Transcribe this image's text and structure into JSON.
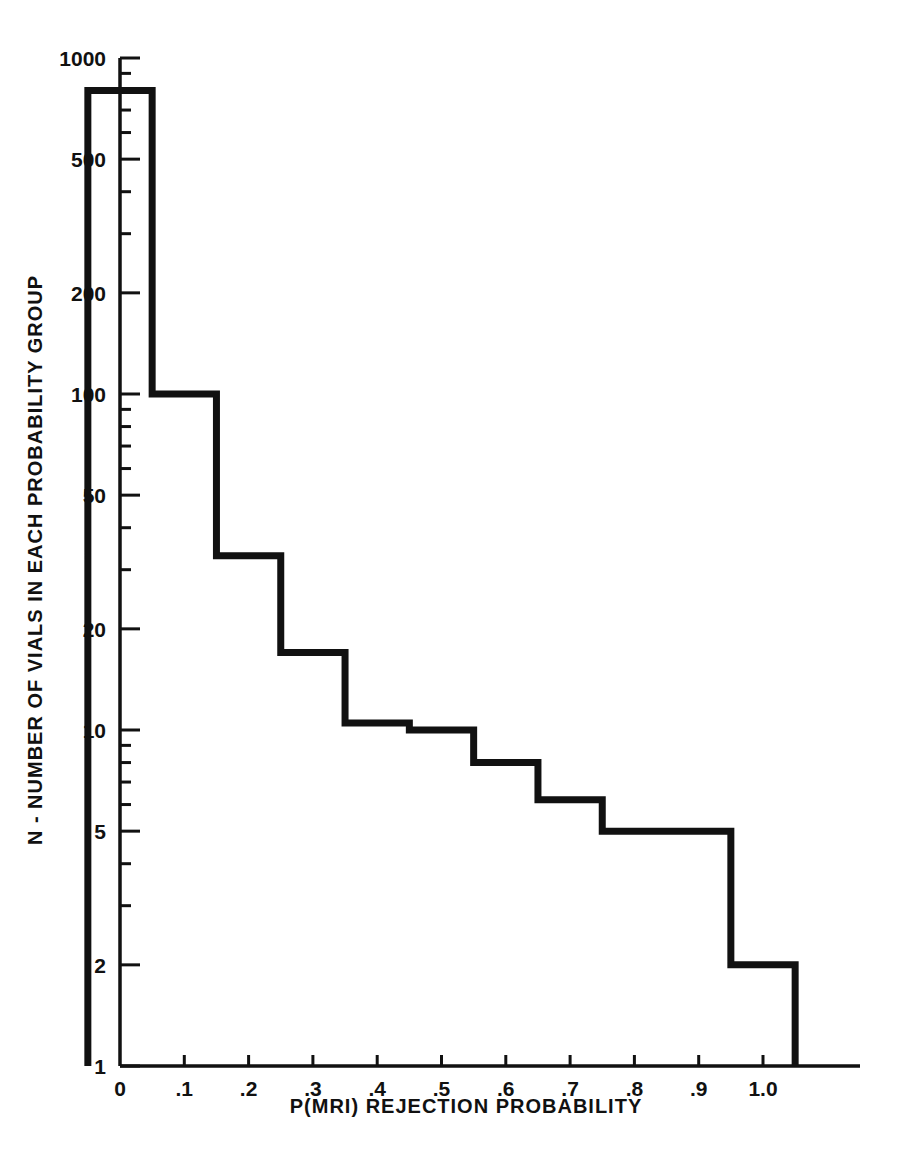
{
  "chart_data": {
    "type": "line",
    "plot_style": "step-histogram",
    "title": "",
    "subtitle": "",
    "xlabel": "P(MRI) REJECTION PROBABILITY",
    "ylabel": "N - NUMBER OF VIALS IN EACH PROBABILITY GROUP",
    "xlim": [
      -0.05,
      1.05
    ],
    "ylim": [
      1,
      1000
    ],
    "yscale": "log",
    "xscale": "linear",
    "grid": false,
    "legend": null,
    "x_ticklabels": [
      "0",
      ".1",
      ".2",
      ".3",
      ".4",
      ".5",
      ".6",
      ".7",
      ".8",
      ".9",
      "1.0"
    ],
    "x_tickvalues": [
      0,
      0.1,
      0.2,
      0.3,
      0.4,
      0.5,
      0.6,
      0.7,
      0.8,
      0.9,
      1.0
    ],
    "y_ticklabels": [
      "1",
      "2",
      "5",
      "10",
      "20",
      "50",
      "100",
      "200",
      "500",
      "1000"
    ],
    "y_tickvalues": [
      1,
      2,
      5,
      10,
      20,
      50,
      100,
      200,
      500,
      1000
    ],
    "y_minor_tickvalues": [
      3,
      4,
      6,
      7,
      8,
      9,
      30,
      40,
      60,
      70,
      80,
      90,
      300,
      400,
      600,
      700,
      800,
      900
    ],
    "categories": [
      0,
      0.1,
      0.2,
      0.3,
      0.4,
      0.5,
      0.6,
      0.7,
      0.8,
      0.9,
      1.0
    ],
    "values": [
      800,
      100,
      33,
      17,
      10.5,
      10,
      8,
      6.2,
      5,
      5,
      2
    ],
    "bin_width": 0.1,
    "series": [
      {
        "name": "Vials per probability group",
        "x": [
          0,
          0.1,
          0.2,
          0.3,
          0.4,
          0.5,
          0.6,
          0.7,
          0.8,
          0.9,
          1.0
        ],
        "values": [
          800,
          100,
          33,
          17,
          10.5,
          10,
          8,
          6.2,
          5,
          5,
          2
        ]
      }
    ],
    "line_color": "#111111",
    "line_width": 7
  },
  "figure": {
    "background": "#ffffff",
    "axis_color": "#111111"
  }
}
